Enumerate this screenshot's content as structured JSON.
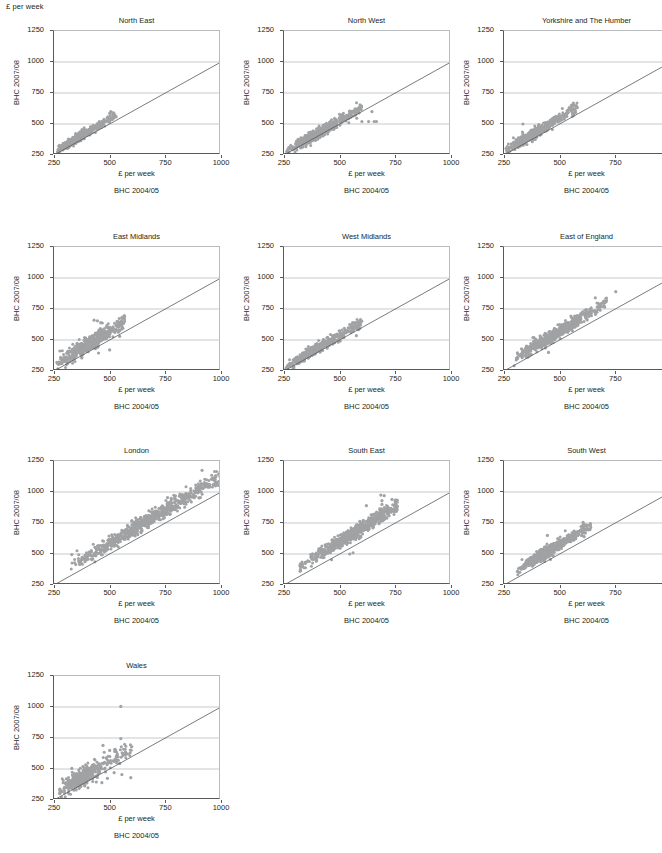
{
  "figure": {
    "corner_label": "£ per week",
    "axis": {
      "x_title": "£ per week",
      "x_subtitle": "BHC 2004/05",
      "y_title": "BHC 2007/08",
      "x_ticks": [
        250,
        500,
        750,
        1000
      ],
      "y_ticks": [
        250,
        500,
        750,
        1000,
        1250
      ],
      "xlim": [
        250,
        1000
      ],
      "ylim": [
        250,
        1250
      ],
      "gridlines_y": [
        500,
        750,
        1000
      ],
      "reference_line": "y = x",
      "point_color": "#a0a2a4",
      "line_color": "#58595b",
      "grid_color": "#b9bcbe"
    },
    "layout": {
      "columns": 3,
      "rows": 4,
      "panel_order": [
        "North East",
        "North West",
        "Yorkshire and The Humber",
        "East Midlands",
        "West Midlands",
        "East of England",
        "London",
        "South East",
        "South West",
        "Wales"
      ]
    }
  },
  "chart_data": [
    {
      "type": "scatter",
      "title": "North East",
      "xlabel": "£ per week",
      "xsublabel": "BHC 2004/05",
      "ylabel": "BHC 2007/08",
      "xlim": [
        250,
        1000
      ],
      "ylim": [
        250,
        1250
      ],
      "seed": 11,
      "n": 430,
      "x_range": [
        265,
        530
      ],
      "x_peak": 360,
      "slope": 1.06,
      "intercept": 8,
      "spread": 16,
      "outliers": [
        [
          505,
          600
        ],
        [
          515,
          590
        ],
        [
          500,
          585
        ]
      ]
    },
    {
      "type": "scatter",
      "title": "North West",
      "xlabel": "£ per week",
      "xsublabel": "BHC 2004/05",
      "ylabel": "BHC 2007/08",
      "xlim": [
        250,
        1000
      ],
      "ylim": [
        250,
        1250
      ],
      "seed": 23,
      "n": 560,
      "x_range": [
        262,
        600
      ],
      "x_peak": 390,
      "slope": 1.03,
      "intercept": 10,
      "spread": 20,
      "outliers": [
        [
          600,
          520
        ],
        [
          630,
          520
        ],
        [
          655,
          520
        ],
        [
          665,
          520
        ],
        [
          645,
          600
        ],
        [
          575,
          590
        ]
      ]
    },
    {
      "type": "scatter",
      "title": "Yorkshire and The Humber",
      "xlabel": "£ per week",
      "xsublabel": "BHC 2004/05",
      "ylabel": "BHC 2007/08",
      "xlim": [
        250,
        1000
      ],
      "ylim": [
        250,
        1250
      ],
      "seed": 37,
      "n": 520,
      "x_range": [
        258,
        580
      ],
      "x_peak": 370,
      "slope": 1.07,
      "intercept": 14,
      "spread": 21,
      "outliers": [
        [
          335,
          500
        ],
        [
          560,
          660
        ],
        [
          565,
          650
        ],
        [
          555,
          640
        ],
        [
          545,
          620
        ]
      ]
    },
    {
      "type": "scatter",
      "title": "East Midlands",
      "xlabel": "£ per week",
      "xsublabel": "BHC 2004/05",
      "ylabel": "BHC 2007/08",
      "xlim": [
        250,
        1000
      ],
      "ylim": [
        250,
        1250
      ],
      "seed": 51,
      "n": 470,
      "x_range": [
        262,
        570
      ],
      "x_peak": 400,
      "slope": 1.1,
      "intercept": 20,
      "spread": 30,
      "outliers": [
        [
          430,
          660
        ],
        [
          445,
          655
        ],
        [
          460,
          640
        ],
        [
          450,
          395
        ],
        [
          500,
          420
        ],
        [
          545,
          530
        ]
      ]
    },
    {
      "type": "scatter",
      "title": "West Midlands",
      "xlabel": "£ per week",
      "xsublabel": "BHC 2004/05",
      "ylabel": "BHC 2007/08",
      "xlim": [
        250,
        1000
      ],
      "ylim": [
        250,
        1250
      ],
      "seed": 67,
      "n": 530,
      "x_range": [
        258,
        600
      ],
      "x_peak": 380,
      "slope": 1.05,
      "intercept": 12,
      "spread": 18,
      "outliers": [
        [
          545,
          625
        ],
        [
          580,
          600
        ],
        [
          590,
          595
        ],
        [
          575,
          535
        ]
      ]
    },
    {
      "type": "scatter",
      "title": "East of England",
      "xlabel": "£ per week",
      "xsublabel": "BHC 2004/05",
      "ylabel": "BHC 2007/08",
      "xlim": [
        250,
        1000
      ],
      "ylim": [
        250,
        1250
      ],
      "seed": 83,
      "n": 540,
      "x_range": [
        295,
        720
      ],
      "x_peak": 470,
      "slope": 1.1,
      "intercept": 22,
      "spread": 24,
      "outliers": [
        [
          660,
          840
        ],
        [
          752,
          890
        ],
        [
          690,
          770
        ],
        [
          700,
          775
        ],
        [
          620,
          745
        ],
        [
          640,
          730
        ],
        [
          450,
          400
        ],
        [
          380,
          520
        ]
      ]
    },
    {
      "type": "scatter",
      "title": "London",
      "xlabel": "£ per week",
      "xsublabel": "BHC 2004/05",
      "ylabel": "BHC 2007/08",
      "xlim": [
        250,
        1000
      ],
      "ylim": [
        250,
        1250
      ],
      "seed": 97,
      "n": 760,
      "x_range": [
        325,
        1000
      ],
      "x_peak": 640,
      "slope": 1.08,
      "intercept": 45,
      "spread": 30,
      "outliers": [
        [
          915,
          1175
        ],
        [
          1000,
          1115
        ],
        [
          965,
          1060
        ],
        [
          975,
          1050
        ],
        [
          760,
          955
        ],
        [
          330,
          495
        ],
        [
          390,
          490
        ]
      ]
    },
    {
      "type": "scatter",
      "title": "South East",
      "xlabel": "£ per week",
      "xsublabel": "BHC 2004/05",
      "ylabel": "BHC 2007/08",
      "xlim": [
        250,
        1000
      ],
      "ylim": [
        250,
        1250
      ],
      "seed": 113,
      "n": 660,
      "x_range": [
        320,
        760
      ],
      "x_peak": 560,
      "slope": 1.12,
      "intercept": 38,
      "spread": 26,
      "outliers": [
        [
          685,
          975
        ],
        [
          700,
          970
        ],
        [
          690,
          930
        ],
        [
          690,
          900
        ],
        [
          735,
          940
        ],
        [
          750,
          935
        ],
        [
          755,
          930
        ],
        [
          620,
          890
        ],
        [
          545,
          500
        ],
        [
          560,
          510
        ]
      ]
    },
    {
      "type": "scatter",
      "title": "South West",
      "xlabel": "£ per week",
      "xsublabel": "BHC 2004/05",
      "ylabel": "BHC 2007/08",
      "xlim": [
        250,
        1000
      ],
      "ylim": [
        250,
        1250
      ],
      "seed": 131,
      "n": 560,
      "x_range": [
        310,
        640
      ],
      "x_peak": 440,
      "slope": 1.1,
      "intercept": 28,
      "spread": 22,
      "outliers": [
        [
          605,
          755
        ],
        [
          610,
          740
        ],
        [
          565,
          685
        ],
        [
          575,
          675
        ],
        [
          625,
          700
        ],
        [
          620,
          695
        ],
        [
          445,
          650
        ],
        [
          610,
          640
        ]
      ]
    },
    {
      "type": "scatter",
      "title": "Wales",
      "xlabel": "£ per week",
      "xsublabel": "BHC 2004/05",
      "ylabel": "BHC 2007/08",
      "xlim": [
        250,
        1000
      ],
      "ylim": [
        250,
        1250
      ],
      "seed": 149,
      "n": 400,
      "x_range": [
        270,
        600
      ],
      "x_peak": 370,
      "slope": 1.09,
      "intercept": 18,
      "spread": 34,
      "outliers": [
        [
          550,
          1005
        ],
        [
          550,
          745
        ],
        [
          470,
          690
        ],
        [
          500,
          650
        ],
        [
          530,
          600
        ],
        [
          545,
          545
        ],
        [
          520,
          470
        ],
        [
          555,
          455
        ],
        [
          595,
          430
        ],
        [
          490,
          425
        ],
        [
          465,
          390
        ],
        [
          440,
          395
        ],
        [
          380,
          520
        ],
        [
          330,
          505
        ]
      ]
    }
  ]
}
